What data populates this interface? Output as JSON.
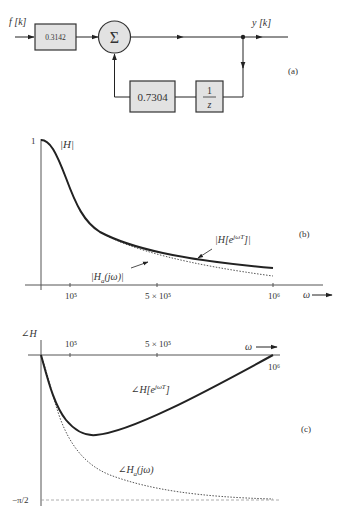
{
  "block_diagram": {
    "input_label": "f [k]",
    "gain_block": "0.3142",
    "summer_symbol": "Σ",
    "output_label": "y [k]",
    "feedback_gain": "0.7304",
    "delay_numerator": "1",
    "delay_denominator": "z",
    "panel_label": "(a)"
  },
  "magnitude_plot": {
    "y_label": "|H|",
    "y_tick_top": "1",
    "x_ticks": [
      "10⁵",
      "5 × 10⁵",
      "10⁶"
    ],
    "x_axis_label": "ω",
    "curve_discrete_label": "|H[e^{jωT}]|",
    "curve_discrete_main": "|H[e",
    "curve_discrete_sup": "jωT",
    "curve_discrete_tail": "]|",
    "curve_analog_label_main": "|H",
    "curve_analog_sub": "a",
    "curve_analog_tail": "(jω)|",
    "panel_label": "(b)"
  },
  "phase_plot": {
    "y_label": "∠H",
    "y_tick_bottom": "−π/2",
    "x_ticks": [
      "10⁵",
      "5 × 10⁵",
      "10⁶"
    ],
    "x_axis_label": "ω",
    "curve_discrete_main": "∠H[e",
    "curve_discrete_sup": "jωT",
    "curve_discrete_tail": "]",
    "curve_analog_main": "∠H",
    "curve_analog_sub": "a",
    "curve_analog_tail": "(jω)",
    "panel_label": "(c)"
  },
  "colors": {
    "stroke": "#222222",
    "block_fill": "#e2e2e2",
    "dotted": "#555555"
  }
}
